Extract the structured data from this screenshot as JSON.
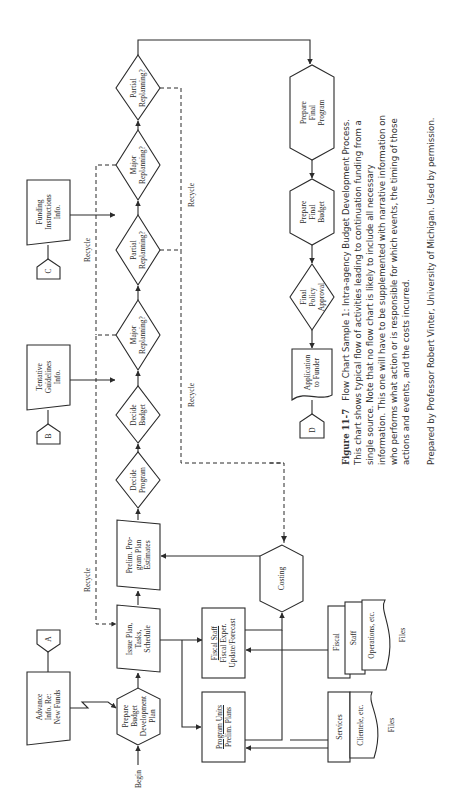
{
  "figure": {
    "number": "Figure 11-7",
    "title": "Flow Chart Sample 1: Intra-agency Budget Development Process.",
    "caption_lines": [
      "This chart shows typical flow of activities leading to continuation funding from a",
      "single source. Note that no flow chart is likely to include all necessary",
      "information. This one will have to be supplemented with narrative information on",
      "who performs what action or is responsible for which events, the timing of those",
      "actions and events, and the costs incurred."
    ],
    "credit": "Prepared by Professor Robert Vinter, University of Michigan. Used by permission."
  },
  "nodes": {
    "begin": "Begin",
    "advance_info": [
      "Advance",
      "Info. Re:",
      "New Funds"
    ],
    "connector_a": "A",
    "prepare_budget_dev_plan": [
      "Prepare",
      "Budget",
      "Development",
      "Plan"
    ],
    "issue_plan": [
      "Issue Plan,",
      "Tasks,",
      "Schedule"
    ],
    "prelim_program_plan": [
      "Prelim. Pro-",
      "gram Plan",
      "Estimates"
    ],
    "decide_program": [
      "Decide",
      "Program"
    ],
    "decide_budget": [
      "Decide",
      "Budget"
    ],
    "tentative_guidelines": [
      "Tentative",
      "Guidelines",
      "Info."
    ],
    "connector_b": "B",
    "major_replanning_1": [
      "Major",
      "Replanning?"
    ],
    "partial_replanning_1": [
      "Partial",
      "Replanning?"
    ],
    "funding_instructions": [
      "Funding",
      "Instructions",
      "Info."
    ],
    "connector_c": "C",
    "major_replanning_2": [
      "Major",
      "Replanning?"
    ],
    "partial_replanning_2": [
      "Partial",
      "Replanning?"
    ],
    "prepare_final_program": [
      "Prepare",
      "Final",
      "Program"
    ],
    "prepare_final_budget": [
      "Prepare",
      "Final",
      "Budget"
    ],
    "final_policy_approval": [
      "Final",
      "Policy",
      "Approval"
    ],
    "application_to_funder": [
      "Application",
      "to Funder"
    ],
    "connector_d": "D",
    "costing": "Costing",
    "fiscal_staff": {
      "title": "Fiscal Staff",
      "lines": [
        "Fiscal Exper.",
        "Update/Forecast"
      ]
    },
    "program_units": {
      "title": "Program Units",
      "lines": [
        "Prelim. Plans"
      ]
    },
    "files_services": {
      "back": "Services",
      "front": "Clientele, etc.",
      "label": "Files"
    },
    "files_fiscal": {
      "back": "Fiscal",
      "middle": "Staff",
      "front": "Operations, etc.",
      "label": "Files"
    },
    "recycle_labels": [
      "Recycle",
      "Recycle",
      "Recycle",
      "Recycle"
    ]
  },
  "colors": {
    "line": "#2b2b2b",
    "text": "#2a2a2a",
    "background": "#ffffff"
  }
}
